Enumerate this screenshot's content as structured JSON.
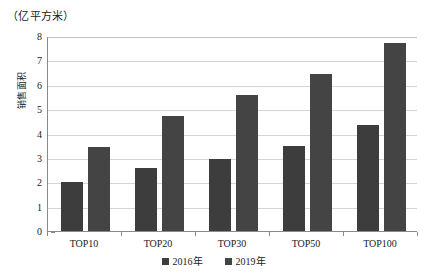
{
  "unit_label": "（亿平方米）",
  "y_axis_title": "销售面积",
  "legend": [
    {
      "label": "2016年",
      "color": "#3d3d3d"
    },
    {
      "label": "2019年",
      "color": "#444444"
    }
  ],
  "chart_data": {
    "type": "bar",
    "title": "",
    "subtitle": "",
    "unit": "亿平方米",
    "xlabel": "",
    "ylabel": "销售面积",
    "categories": [
      "TOP10",
      "TOP20",
      "TOP30",
      "TOP50",
      "TOP100"
    ],
    "series": [
      {
        "name": "2016年",
        "color": "#3d3d3d",
        "values": [
          2.0,
          2.6,
          2.95,
          3.5,
          4.35
        ]
      },
      {
        "name": "2019年",
        "color": "#444444",
        "values": [
          3.45,
          4.7,
          5.6,
          6.45,
          7.7
        ]
      }
    ],
    "ylim": [
      0,
      8
    ],
    "y_ticks": [
      0,
      1,
      2,
      3,
      4,
      5,
      6,
      7,
      8
    ],
    "y_tick_labels": [
      "0",
      "1",
      "2",
      "3",
      "4",
      "5",
      "6",
      "7",
      "8"
    ],
    "grid": true,
    "grid_axis": "y",
    "legend_position": "bottom",
    "bar_orientation": "vertical"
  }
}
